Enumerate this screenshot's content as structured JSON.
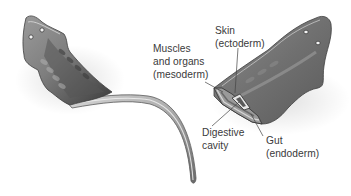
{
  "figure": {
    "labels": [
      {
        "id": "mesoderm",
        "lines": [
          "Muscles",
          "and organs",
          "(mesoderm)"
        ]
      },
      {
        "id": "ectoderm",
        "lines": [
          "Skin",
          "(ectoderm)"
        ]
      },
      {
        "id": "digestive",
        "lines": [
          "Digestive",
          "cavity"
        ]
      },
      {
        "id": "endoderm",
        "lines": [
          "Gut",
          "(endoderm)"
        ]
      }
    ]
  },
  "colors": {
    "body_dark": "#4a4a4a",
    "body_mid": "#8a8a8a",
    "body_light": "#c9c9c9",
    "label_text": "#3a3a3a",
    "leader_line": "#444444"
  }
}
